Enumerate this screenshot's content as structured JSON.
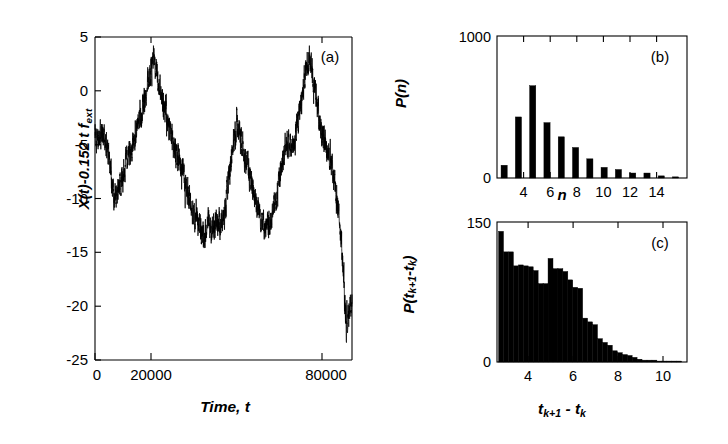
{
  "figure": {
    "background": "#ffffff",
    "ink": "#000000",
    "panels": [
      "a",
      "b",
      "c"
    ]
  },
  "panel_a": {
    "letter": "(a)",
    "xlabel_text": "Time, t",
    "ylabel_text": "X(t)-0.152 t f_ext",
    "xticklabels": [
      "0",
      "20000",
      "80000"
    ],
    "yticklabels": [
      "5",
      "0",
      "-5",
      "-10",
      "-15",
      "-20",
      "-25"
    ]
  },
  "panel_b": {
    "letter": "(b)",
    "xlabel_text": "n",
    "ylabel_text": "P(n)",
    "xticklabels": [
      "4",
      "6",
      "8",
      "10",
      "12",
      "14"
    ],
    "yticklabels": [
      "1000",
      "0"
    ]
  },
  "panel_c": {
    "letter": "(c)",
    "xlabel_text": "t_k+1 - t_k",
    "ylabel_text": "P(t_k+1-t_k)",
    "xticklabels": [
      "4",
      "6",
      "8",
      "10"
    ],
    "yticklabels": [
      "150",
      "0"
    ]
  },
  "chart_data": [
    {
      "type": "line",
      "panel": "a",
      "title": "(a)",
      "xlabel": "Time, t",
      "ylabel": "X(t)-0.152 t f_ext",
      "xlim": [
        0,
        92000
      ],
      "ylim": [
        -25,
        5
      ],
      "xticks": [
        0,
        20000,
        80000
      ],
      "yticks": [
        5,
        0,
        -5,
        -10,
        -15,
        -20,
        -25
      ],
      "grid": false,
      "legend": "none",
      "note": "Noisy random-walk trajectory with slow large excursions; sampled envelope values (x in units of t, y in plot units)",
      "x": [
        0,
        1500,
        3000,
        4500,
        6000,
        7500,
        9000,
        10500,
        12000,
        13500,
        15000,
        16500,
        18000,
        19500,
        21000,
        22500,
        24000,
        25500,
        27000,
        28500,
        30000,
        31500,
        33000,
        34500,
        36000,
        37500,
        39000,
        40500,
        42000,
        43500,
        45000,
        46500,
        48000,
        49500,
        51000,
        52500,
        54000,
        55500,
        57000,
        58500,
        60000,
        61500,
        63000,
        64500,
        66000,
        67500,
        69000,
        70500,
        72000,
        73500,
        75000,
        76500,
        78000,
        79500,
        81000,
        82500,
        84000,
        85500,
        87000,
        88500,
        90000,
        91500
      ],
      "y": [
        -4.0,
        -4.3,
        -3.6,
        -5.2,
        -8.5,
        -10.0,
        -8.8,
        -7.0,
        -6.0,
        -5.0,
        -3.5,
        -2.0,
        -0.5,
        1.5,
        3.0,
        1.0,
        -0.8,
        -2.5,
        -4.0,
        -5.5,
        -6.5,
        -7.8,
        -9.0,
        -10.5,
        -11.5,
        -12.8,
        -13.5,
        -12.5,
        -13.0,
        -12.0,
        -12.5,
        -11.5,
        -8.0,
        -4.5,
        -3.0,
        -4.5,
        -6.5,
        -8.0,
        -9.5,
        -11.0,
        -12.0,
        -12.8,
        -12.0,
        -10.5,
        -8.5,
        -6.0,
        -5.0,
        -5.5,
        -4.0,
        -1.5,
        1.0,
        3.2,
        1.5,
        -1.0,
        -3.5,
        -5.0,
        -6.0,
        -8.0,
        -11.0,
        -15.0,
        -22.0,
        -19.5
      ]
    },
    {
      "type": "bar",
      "panel": "b",
      "title": "(b)",
      "xlabel": "n",
      "ylabel": "P(n)",
      "xlim": [
        1.5,
        14.8
      ],
      "ylim": [
        0,
        1000
      ],
      "xticks": [
        4,
        6,
        8,
        10,
        12,
        14
      ],
      "yticks": [
        0,
        1000
      ],
      "grid": false,
      "legend": "none",
      "categories": [
        2,
        3,
        4,
        5,
        6,
        7,
        8,
        9,
        10,
        11,
        12,
        13,
        14
      ],
      "values": [
        90,
        430,
        650,
        390,
        290,
        215,
        135,
        75,
        60,
        35,
        35,
        15,
        8
      ]
    },
    {
      "type": "bar",
      "panel": "c",
      "title": "(c)",
      "xlabel": "t_k+1 - t_k",
      "ylabel": "P(t_k+1-t_k)",
      "xlim": [
        2.55,
        11.0
      ],
      "ylim": [
        0,
        150
      ],
      "xticks": [
        4,
        6,
        8,
        10
      ],
      "yticks": [
        0,
        150
      ],
      "grid": false,
      "legend": "none",
      "bin_width": 0.22,
      "bin_starts": [
        2.62,
        2.84,
        3.06,
        3.28,
        3.5,
        3.72,
        3.94,
        4.16,
        4.38,
        4.6,
        4.82,
        5.04,
        5.26,
        5.48,
        5.7,
        5.92,
        6.14,
        6.36,
        6.58,
        6.8,
        7.02,
        7.24,
        7.46,
        7.68,
        7.9,
        8.12,
        8.34,
        8.56,
        8.78,
        9.0,
        9.22,
        9.44,
        9.66,
        9.88,
        10.1,
        10.32,
        10.54
      ],
      "values": [
        140,
        118,
        118,
        103,
        104,
        103,
        102,
        98,
        84,
        84,
        111,
        100,
        100,
        97,
        88,
        80,
        79,
        47,
        43,
        40,
        25,
        21,
        18,
        12,
        10,
        8,
        7,
        5,
        3,
        2,
        2,
        2,
        1,
        1,
        1,
        1,
        1
      ]
    }
  ]
}
